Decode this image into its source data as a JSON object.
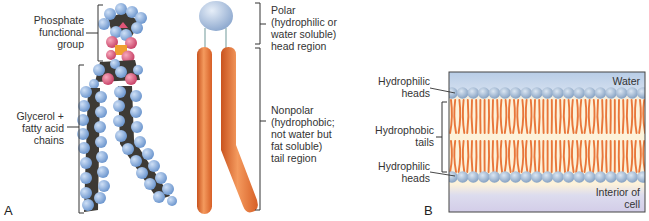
{
  "panel_a": {
    "letter": "A",
    "labels": {
      "phosphate": [
        "Phosphate",
        "functional",
        "group"
      ],
      "glycerol": [
        "Glycerol +",
        "fatty acid",
        "chains"
      ],
      "polar": [
        "Polar",
        "(hydrophilic or",
        "water soluble)",
        "head region"
      ],
      "nonpolar": [
        "Nonpolar",
        "(hydrophobic;",
        "not water but",
        "fat soluble)",
        "tail region"
      ]
    }
  },
  "panel_b": {
    "letter": "B",
    "labels": {
      "top_heads": [
        "Hydrophilic",
        "heads"
      ],
      "tails": [
        "Hydrophobic",
        "tails"
      ],
      "bottom_heads": [
        "Hydrophilic",
        "heads"
      ],
      "water": "Water",
      "interior": [
        "Interior of",
        "cell"
      ]
    }
  },
  "colors": {
    "hydrogen_blue": "#8fb4e0",
    "carbon_dark": "#3d3a35",
    "oxygen_pink": "#e06a86",
    "phosphorus_orange": "#f0a030",
    "head_sphere": "#a9c0de",
    "tail_orange": "#e8763a",
    "membrane_water": "#c3d6ea",
    "membrane_core": "#fdf1d6",
    "membrane_interior": "#d8d3ea"
  }
}
